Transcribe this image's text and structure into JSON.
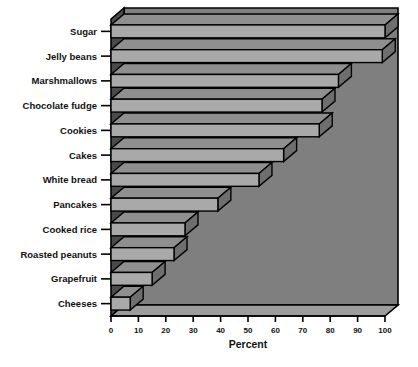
{
  "chart_data": {
    "type": "bar",
    "orientation": "horizontal",
    "title": "",
    "subtitle": "",
    "xlabel": "Percent",
    "ylabel": "",
    "xlim": [
      0,
      100
    ],
    "xticks": [
      0,
      10,
      20,
      30,
      40,
      50,
      60,
      70,
      80,
      90,
      100
    ],
    "xtick_labels": [
      "0",
      "10",
      "20",
      "30",
      "40",
      "50",
      "60",
      "70",
      "80",
      "90",
      "100"
    ],
    "grid": false,
    "legend": null,
    "style": "3d-perspective-bars",
    "categories": [
      "Sugar",
      "Jelly beans",
      "Marshmallows",
      "Chocolate fudge",
      "Cookies",
      "Cakes",
      "White bread",
      "Pancakes",
      "Cooked rice",
      "Roasted peanuts",
      "Grapefruit",
      "Cheeses"
    ],
    "values": [
      100,
      99,
      83,
      77,
      76,
      63,
      54,
      39,
      27,
      23,
      15,
      7
    ],
    "colors": {
      "bar_face": "#a9a9a9",
      "bar_top": "#8f8f8f",
      "bar_edge": "#000000",
      "panel_back": "#7f7f7f",
      "panel_floor": "#9a9a9a",
      "panel_left_wall": "#4a4a4a",
      "axis": "#000000",
      "text": "#111111",
      "background": "#ffffff"
    }
  },
  "caption": {
    "smudge_text": ""
  }
}
